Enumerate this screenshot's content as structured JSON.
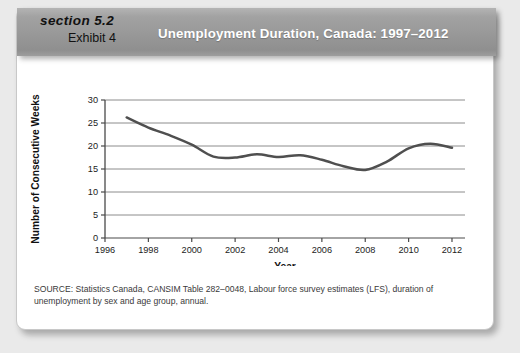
{
  "header": {
    "section_label": "section 5.2",
    "exhibit_label": "Exhibit 4",
    "title": "Unemployment Duration, Canada: 1997–2012",
    "band_color": "#989898",
    "title_color": "#ffffff"
  },
  "source": {
    "line1": "SOURCE: Statistics Canada, CANSIM Table 282–0048, Labour force survey estimates (LFS), duration of",
    "line2": "unemployment by sex and age group, annual."
  },
  "chart_data": {
    "type": "line",
    "title": "Unemployment Duration, Canada: 1997–2012",
    "xlabel": "Year",
    "ylabel": "Number of Consecutive Weeks",
    "xlim": [
      1996,
      2012.6
    ],
    "ylim": [
      0,
      30
    ],
    "xticks": [
      1996,
      1998,
      2000,
      2002,
      2004,
      2006,
      2008,
      2010,
      2012
    ],
    "yticks": [
      0,
      5,
      10,
      15,
      20,
      25,
      30
    ],
    "grid": "horizontal",
    "legend": "none",
    "line_color": "#4f4f4f",
    "x": [
      1997,
      1998,
      1999,
      2000,
      2001,
      2002,
      2003,
      2004,
      2005,
      2006,
      2007,
      2008,
      2009,
      2010,
      2011,
      2012
    ],
    "values": [
      26.2,
      24.0,
      22.3,
      20.3,
      17.7,
      17.5,
      18.2,
      17.6,
      18.0,
      17.0,
      15.6,
      14.8,
      16.6,
      19.5,
      20.5,
      19.6
    ],
    "series": [
      {
        "name": "Average duration of unemployment",
        "values": [
          26.2,
          24.0,
          22.3,
          20.3,
          17.7,
          17.5,
          18.2,
          17.6,
          18.0,
          17.0,
          15.6,
          14.8,
          16.6,
          19.5,
          20.5,
          19.6
        ]
      }
    ]
  }
}
